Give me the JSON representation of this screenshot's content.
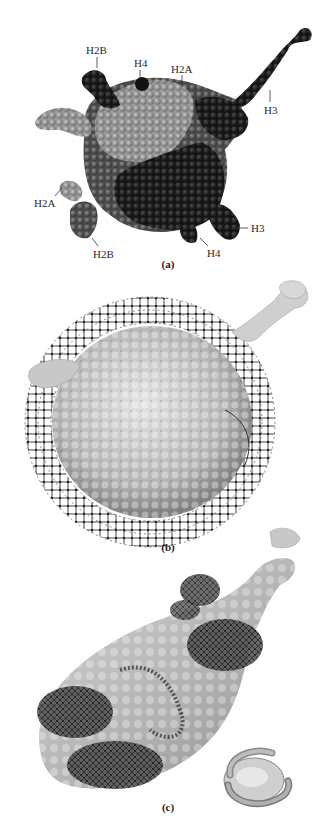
{
  "figure": {
    "panels": [
      {
        "id": "a",
        "label": "(a)",
        "description": "Space-filling model of histone octamer core",
        "histone_labels": [
          {
            "text": "H2B",
            "x": 86,
            "y": 45
          },
          {
            "text": "H4",
            "x": 135,
            "y": 58
          },
          {
            "text": "H2A",
            "x": 171,
            "y": 64
          },
          {
            "text": "H3",
            "x": 264,
            "y": 105
          },
          {
            "text": "H2A",
            "x": 34,
            "y": 198
          },
          {
            "text": "H3",
            "x": 251,
            "y": 223
          },
          {
            "text": "H2B",
            "x": 93,
            "y": 249
          },
          {
            "text": "H4",
            "x": 207,
            "y": 248
          }
        ]
      },
      {
        "id": "b",
        "label": "(b)",
        "description": "Surface model of histone core wrapped by DNA, top view"
      },
      {
        "id": "c",
        "label": "(c)",
        "description": "Surface model of nucleosome, side view, with schematic inset"
      }
    ],
    "colors": {
      "background": "#ffffff",
      "text": "#2a2a2a",
      "dark_histone": "#1c1c1c",
      "mid_histone": "#5a5a5a",
      "light_histone": "#a8a8a8",
      "dna": "#3a3a3a",
      "surface": "#b8b8b8"
    }
  }
}
